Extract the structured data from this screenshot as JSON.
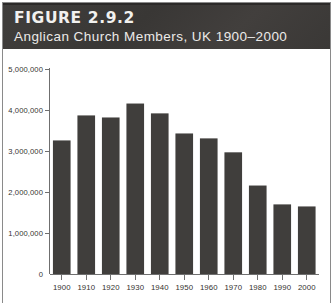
{
  "figure": {
    "number_label": "FIGURE 2.9.2",
    "subtitle": "Anglican Church Members, UK 1900–2000"
  },
  "colors": {
    "header_band": "#3c3a38",
    "header_text": "#f2f1ef",
    "bar_fill": "#403e3c",
    "axis": "#6f6f6f",
    "plot_background": "#ffffff",
    "frame_border": "#8a8a8a"
  },
  "chart_data": {
    "type": "bar",
    "title": "Anglican Church Members, UK 1900–2000",
    "subtitle": "",
    "xlabel": "",
    "ylabel": "",
    "categories": [
      "1900",
      "1910",
      "1920",
      "1930",
      "1940",
      "1950",
      "1960",
      "1970",
      "1980",
      "1990",
      "2000"
    ],
    "values": [
      3270000,
      3880000,
      3830000,
      4170000,
      3930000,
      3440000,
      3320000,
      2980000,
      2170000,
      1710000,
      1660000
    ],
    "ylim": [
      0,
      5000000
    ],
    "ytick_values": [
      0,
      1000000,
      2000000,
      3000000,
      4000000,
      5000000
    ],
    "ytick_labels": [
      "0",
      "1,000,000",
      "2,000,000",
      "3,000,000",
      "4,000,000",
      "5,000,000"
    ],
    "xtick_labels": [
      "1900",
      "1910",
      "1920",
      "1930",
      "1940",
      "1950",
      "1960",
      "1970",
      "1980",
      "1990",
      "2000"
    ],
    "grid": false,
    "legend": false,
    "legend_position": "none",
    "series": [
      {
        "name": "Anglican Church Members",
        "values": [
          3270000,
          3880000,
          3830000,
          4170000,
          3930000,
          3440000,
          3320000,
          2980000,
          2170000,
          1710000,
          1660000
        ]
      }
    ]
  }
}
